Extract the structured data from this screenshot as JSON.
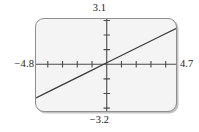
{
  "figure": {
    "kind": "graphing-calculator-viewport",
    "width": 199,
    "height": 132
  },
  "labels": {
    "y_max": "3.1",
    "y_min": "−3.2",
    "x_min": "−4.8",
    "x_max": "4.7"
  },
  "colors": {
    "screen_fill": "#f4f4f4",
    "screen_border": "#8e8e8e",
    "axis": "#4a4a4a",
    "curve": "#3a3a3a",
    "text": "#1c1c1c",
    "page_background": "#ffffff"
  },
  "chart_data": {
    "type": "line",
    "title": "",
    "xlabel": "",
    "ylabel": "",
    "xlim": [
      -4.8,
      4.7
    ],
    "ylim": [
      -3.2,
      3.1
    ],
    "grid": false,
    "legend": "none",
    "axes": {
      "x_axis_at_y": 0,
      "y_axis_at_x": 0,
      "x_tick_interval": 1,
      "y_tick_interval": 1,
      "x_ticks": [
        -4,
        -3,
        -2,
        -1,
        1,
        2,
        3,
        4
      ],
      "y_ticks": [
        -3,
        -2,
        -1,
        1,
        2,
        3
      ],
      "tick_labels_shown": false
    },
    "series": [
      {
        "name": "line",
        "equation": "y = 0.5x + 0.1",
        "slope": 0.5,
        "intercept": 0.1,
        "x": [
          -4.8,
          -3.6,
          -2.4,
          -1.2,
          0,
          1.2,
          2.4,
          3.6,
          4.7
        ],
        "y": [
          -2.3,
          -1.7,
          -1.1,
          -0.5,
          0.1,
          0.7,
          1.3,
          1.9,
          2.45
        ]
      }
    ],
    "annotations": [
      {
        "text": "3.1",
        "position": "top-center",
        "meaning": "Ymax"
      },
      {
        "text": "−3.2",
        "position": "bottom-center",
        "meaning": "Ymin"
      },
      {
        "text": "−4.8",
        "position": "left-middle",
        "meaning": "Xmin"
      },
      {
        "text": "4.7",
        "position": "right-middle",
        "meaning": "Xmax"
      }
    ]
  }
}
